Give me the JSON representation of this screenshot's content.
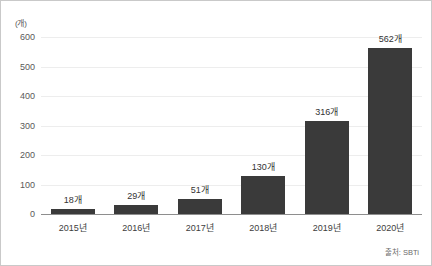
{
  "chart_data": {
    "type": "bar",
    "title": "",
    "xlabel": "",
    "ylabel": "",
    "unit_label": "(개)",
    "categories": [
      "2015년",
      "2016년",
      "2017년",
      "2018년",
      "2019년",
      "2020년"
    ],
    "values": [
      18,
      29,
      51,
      130,
      316,
      562
    ],
    "point_labels": [
      "18개",
      "29개",
      "51개",
      "130개",
      "316개",
      "562개"
    ],
    "ylim": [
      0,
      600
    ],
    "ytick_values": [
      0,
      100,
      200,
      300,
      400,
      500,
      600
    ],
    "ytick_labels": [
      "0",
      "100",
      "200",
      "300",
      "400",
      "500",
      "600"
    ],
    "grid": true,
    "legend": false,
    "bar_color": "#3a3a3a",
    "gridline_color": "#ededed",
    "baseline_color": "#8e8e8e"
  },
  "source": {
    "text": "출처: SBTi"
  }
}
